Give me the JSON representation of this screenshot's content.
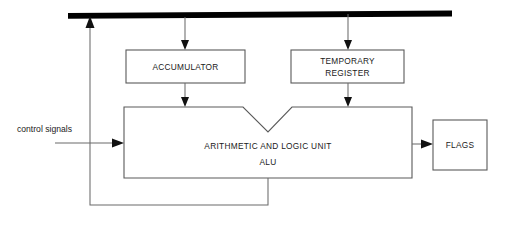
{
  "diagram": {
    "colors": {
      "bus": "#000000",
      "box_stroke": "#5a5a5a",
      "wire": "#6b6b6b",
      "arrow": "#111111",
      "background": "#ffffff",
      "text": "#1a1a1a"
    },
    "bus": {
      "name": "internal data bus",
      "label": ""
    },
    "blocks": [
      {
        "id": "accumulator",
        "lines": [
          "ACCUMULATOR"
        ]
      },
      {
        "id": "temporary-register",
        "lines": [
          "TEMPORARY",
          "REGISTER"
        ]
      },
      {
        "id": "alu",
        "lines": [
          "ARITHMETIC AND LOGIC UNIT",
          "ALU"
        ]
      },
      {
        "id": "flags",
        "lines": [
          "FLAGS"
        ]
      }
    ],
    "labels": {
      "control_signals": "control signals"
    },
    "connections": [
      {
        "from": "bus",
        "to": "accumulator",
        "arrow": "down"
      },
      {
        "from": "bus",
        "to": "temporary-register",
        "arrow": "down"
      },
      {
        "from": "accumulator",
        "to": "alu",
        "arrow": "down"
      },
      {
        "from": "temporary-register",
        "to": "alu",
        "arrow": "down"
      },
      {
        "from": "control-signals",
        "to": "alu",
        "arrow": "right"
      },
      {
        "from": "alu",
        "to": "flags",
        "arrow": "right"
      },
      {
        "from": "alu",
        "to": "bus",
        "arrow": "up"
      }
    ]
  }
}
